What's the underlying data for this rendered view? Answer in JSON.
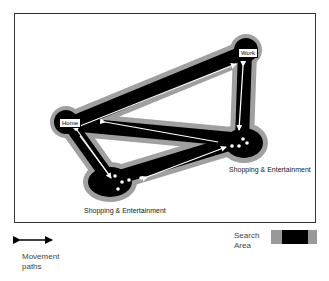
{
  "diagram": {
    "nodes": [
      {
        "id": "home",
        "label": "Home"
      },
      {
        "id": "work",
        "label": "Work"
      },
      {
        "id": "shop_right",
        "label": "Shopping & Entertainment"
      },
      {
        "id": "shop_bottom",
        "label": "Shopping & Entertainment"
      }
    ],
    "edges": [
      {
        "from": "home",
        "to": "work"
      },
      {
        "from": "work",
        "to": "shop_right"
      },
      {
        "from": "shop_right",
        "to": "home"
      },
      {
        "from": "home",
        "to": "shop_bottom"
      },
      {
        "from": "shop_bottom",
        "to": "shop_right"
      }
    ],
    "colors": {
      "search_area_core": "#000000",
      "search_area_halo": "#999999",
      "path": "#ffffff"
    }
  },
  "legend": {
    "movement_label_line1": "Movement",
    "movement_label_line2": "paths",
    "search_label_line1": "Search",
    "search_label_line2": "Area"
  }
}
